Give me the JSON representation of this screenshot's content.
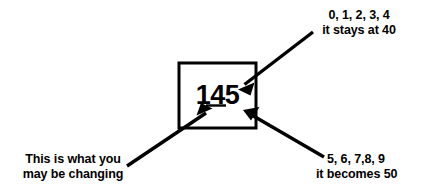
{
  "diagram": {
    "title_value": "145",
    "box": {
      "value": "145",
      "stroke_color": "#000000",
      "fill_color": "#ffffff"
    },
    "annotations": {
      "top_right": {
        "line_1": "0, 1, 2, 3, 4",
        "line_2": "it stays at 40"
      },
      "bottom_right": {
        "line_1": "5, 6, 7,8, 9",
        "line_2": "it becomes 50"
      },
      "bottom_left": {
        "line_1": "This is what you",
        "line_2": "may be changing"
      }
    },
    "arrows": [
      {
        "name": "arrow-to-tens-digit",
        "from": "top_right",
        "points_to": "digit-4"
      },
      {
        "name": "arrow-to-units-digit",
        "from": "bottom_right",
        "points_to": "digit-5"
      },
      {
        "name": "arrow-to-rounding-digit",
        "from": "bottom_left",
        "points_to": "digit-4-underline"
      }
    ],
    "colors": {
      "ink": "#000000",
      "background": "#ffffff"
    }
  }
}
